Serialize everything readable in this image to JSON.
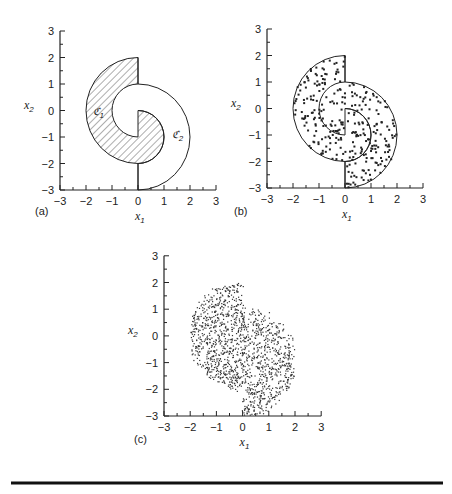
{
  "figure": {
    "rule_color": "#111111",
    "panels": [
      {
        "id": "a",
        "label": "(a)",
        "xlabel": "x",
        "xlabel_sub": "1",
        "ylabel": "x",
        "ylabel_sub": "2"
      },
      {
        "id": "b",
        "label": "(b)",
        "xlabel": "x",
        "xlabel_sub": "1",
        "ylabel": "x",
        "ylabel_sub": "2"
      },
      {
        "id": "c",
        "label": "(c)",
        "xlabel": "x",
        "xlabel_sub": "1",
        "ylabel": "x",
        "ylabel_sub": "2"
      }
    ],
    "region_labels": {
      "c1": "ℭ",
      "c1_sub": "1",
      "c2": "ℭ",
      "c2_sub": "2"
    },
    "caption_note": "caption text below rule is cut off"
  },
  "chart_data": [
    {
      "type": "area",
      "title": "(a) Two-class spiral regions",
      "xlabel": "x1",
      "ylabel": "x2",
      "xlim": [
        -3,
        3
      ],
      "ylim": [
        -3,
        3
      ],
      "x_ticks": [
        "-3",
        "-2",
        "-1",
        "0",
        "1",
        "2",
        "3"
      ],
      "y_ticks": [
        "3",
        "2",
        "1",
        "0",
        "-1",
        "-2",
        "-3"
      ],
      "grid": false,
      "regions": [
        {
          "name": "C1",
          "fill": "hatched",
          "description": "left half-annulus centered (0,0) radii 1-2 for x<0, plus right half-disk centered (0,-1) radius 1 for x>0"
        },
        {
          "name": "C2",
          "fill": "white",
          "description": "right half-annulus centered (0,-1) radii 1-2 for x>0, plus left half-disk centered (0,0) radius 1 for x<0"
        }
      ],
      "annotations": [
        {
          "text": "C1",
          "x": -1.6,
          "y": 0
        },
        {
          "text": "C2",
          "x": 1.4,
          "y": -0.9
        }
      ]
    },
    {
      "type": "scatter",
      "title": "(b) Training samples in the spiral regions",
      "xlabel": "x1",
      "ylabel": "x2",
      "xlim": [
        -3,
        3
      ],
      "ylim": [
        -3,
        3
      ],
      "x_ticks": [
        "-3",
        "-2",
        "-1",
        "0",
        "1",
        "2",
        "3"
      ],
      "y_ticks": [
        "3",
        "2",
        "1",
        "0",
        "-1",
        "-2",
        "-3"
      ],
      "grid": false,
      "series": [
        {
          "name": "samples",
          "marker": "small square",
          "count_approx": 300,
          "region": "union of C1 and C2 (disk-like spiral, x from -2 to 2, y from -3 to 2)"
        }
      ]
    },
    {
      "type": "scatter",
      "title": "(c) Dense point cloud",
      "xlabel": "x1",
      "ylabel": "x2",
      "xlim": [
        -3,
        3
      ],
      "ylim": [
        -3,
        3
      ],
      "x_ticks": [
        "-3",
        "-2",
        "-1",
        "0",
        "1",
        "2",
        "3"
      ],
      "y_ticks": [
        "3",
        "2",
        "1",
        "0",
        "-1",
        "-2",
        "-3"
      ],
      "grid": false,
      "series": [
        {
          "name": "points",
          "marker": "dot",
          "count_approx": 1500,
          "region": "irregular spiral-shaped blob, x from -2 to 2, y from -3 to 2"
        }
      ]
    }
  ]
}
